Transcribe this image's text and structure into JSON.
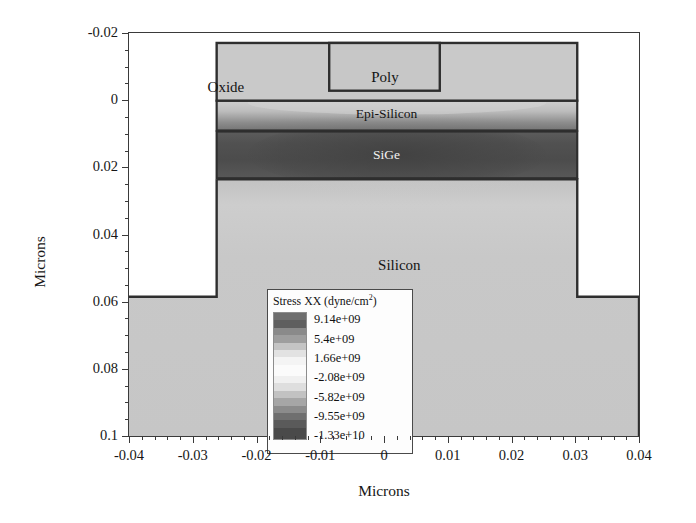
{
  "chart_data": {
    "type": "heatmap",
    "title": "",
    "xlabel": "Microns",
    "ylabel": "Microns",
    "xlim": [
      -0.04,
      0.04
    ],
    "ylim": [
      -0.02,
      0.1
    ],
    "y_axis_inverted": true,
    "grid": false,
    "x_ticks": [
      "-0.04",
      "-0.03",
      "-0.02",
      "-0.01",
      "0",
      "0.01",
      "0.02",
      "0.03",
      "0.04"
    ],
    "x_tick_values": [
      -0.04,
      -0.03,
      -0.02,
      -0.01,
      0,
      0.01,
      0.02,
      0.03,
      0.04
    ],
    "x_minor_tick_count_between": 4,
    "y_ticks": [
      "-0.02",
      "0",
      "0.02",
      "0.04",
      "0.06",
      "0.08",
      "0.1"
    ],
    "y_tick_values": [
      -0.02,
      0,
      0.02,
      0.04,
      0.06,
      0.08,
      0.1
    ],
    "y_minor_tick_count_between": 3,
    "colormap": "grayscale-diverging",
    "quantity": "Stress XX",
    "units": "dyne/cm2",
    "colorbar": {
      "title_main": "Stress XX (dyne/cm",
      "title_sup": "2",
      "title_tail": ")",
      "values": [
        "9.14e+09",
        "5.4e+09",
        "1.66e+09",
        "-2.08e+09",
        "-5.82e+09",
        "-9.55e+09",
        "-1.33e+10"
      ],
      "numeric_values": [
        9140000000.0,
        5400000000.0,
        1660000000.0,
        -2080000000.0,
        -5820000000.0,
        -9550000000.0,
        -13300000000.0
      ],
      "max": 9140000000.0,
      "min": -13300000000.0
    },
    "regions": [
      {
        "name": "Oxide",
        "label": "Oxide",
        "x": -0.0185,
        "y": -0.0115,
        "fill": "#c9c9c9",
        "label_style": "dark"
      },
      {
        "name": "Poly",
        "label": "Poly",
        "x": -0.0005,
        "y": -0.0148,
        "fill": "#c7c7c7",
        "label_style": "dark"
      },
      {
        "name": "Epi-Silicon",
        "label": "Epi-Silicon",
        "x": 0.001,
        "y": 0.0035,
        "fill": "gradient",
        "label_style": "dark"
      },
      {
        "name": "SiGe",
        "label": "SiGe",
        "x": 0.001,
        "y": 0.016,
        "fill": "gradient",
        "label_style": "light"
      },
      {
        "name": "Silicon",
        "label": "Silicon",
        "x": 0.0045,
        "y": 0.05,
        "fill": "gradient",
        "label_style": "dark"
      }
    ],
    "geometry": {
      "mesa_left": -0.027,
      "mesa_right": 0.029,
      "substrate_step_y": 0.06,
      "oxide_top": -0.02,
      "oxide_bottom": 0.0,
      "poly_left": -0.0095,
      "poly_right": 0.008,
      "poly_top": -0.02,
      "poly_bottom": -0.0035,
      "epi_top": 0.0,
      "epi_bottom": 0.009,
      "sige_top": 0.009,
      "sige_bottom": 0.0232,
      "silicon_top": 0.0232,
      "silicon_bottom": 0.1
    }
  }
}
